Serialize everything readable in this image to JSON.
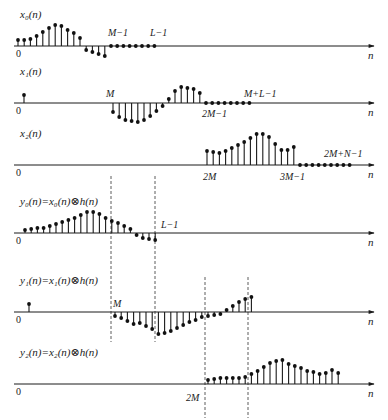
{
  "figure": {
    "axis_label": "n",
    "zero_label": "0"
  },
  "panels": [
    {
      "id": "x0",
      "title": "x₀(n)",
      "axis_y": 46,
      "ticks": [
        {
          "text": "M−1",
          "x": 108,
          "y": 36
        },
        {
          "text": "L−1",
          "x": 150,
          "y": 36
        }
      ],
      "stems": {
        "x_start": 18,
        "dx": 6.2,
        "values": [
          6,
          6,
          7,
          10,
          14,
          18,
          21,
          20,
          16,
          13,
          8,
          -4,
          -6,
          -8,
          -10,
          0,
          0,
          0,
          0,
          0,
          0,
          0,
          0
        ]
      }
    },
    {
      "id": "x1",
      "title": "x₁(n)",
      "axis_y": 103,
      "ticks": [
        {
          "text": "M",
          "x": 106,
          "y": 97
        },
        {
          "text": "2M−1",
          "x": 202,
          "y": 117
        },
        {
          "text": "M+L−1",
          "x": 244,
          "y": 97
        }
      ],
      "stems": {
        "x_start": 24,
        "dx": 6.2,
        "values_sparse": [
          {
            "i": 0,
            "v": 8
          }
        ],
        "x_start2": 113,
        "values": [
          -9,
          -14,
          -17,
          -18,
          -19,
          -17,
          -13,
          -8,
          -3,
          4,
          12,
          16,
          15,
          14,
          10,
          0,
          0,
          0,
          0,
          0,
          0,
          0,
          0
        ]
      }
    },
    {
      "id": "x2",
      "title": "x₂(n)",
      "axis_y": 165,
      "ticks": [
        {
          "text": "2M",
          "x": 203,
          "y": 180
        },
        {
          "text": "3M−1",
          "x": 280,
          "y": 180
        },
        {
          "text": "2M+N−1",
          "x": 324,
          "y": 157
        }
      ],
      "stems": {
        "x_start": 207,
        "dx": 6.2,
        "values": [
          14,
          13,
          12,
          14,
          17,
          20,
          23,
          27,
          31,
          31,
          28,
          21,
          15,
          15,
          18,
          0,
          0,
          0,
          0,
          0,
          0,
          0,
          0,
          0
        ]
      }
    },
    {
      "id": "y0",
      "title": "y₀(n)=x₀(n)⊗h(n)",
      "axis_y": 233,
      "ticks": [
        {
          "text": "L−1",
          "x": 161,
          "y": 228
        }
      ],
      "stems": {
        "x_start": 25,
        "dx": 6.2,
        "values": [
          3,
          4,
          5,
          5,
          7,
          9,
          11,
          13,
          15,
          18,
          21,
          21,
          19,
          15,
          12,
          10,
          7,
          4,
          -2,
          -5,
          -6,
          -7
        ]
      }
    },
    {
      "id": "y1",
      "title": "y₁(n)=x₁(n)⊗h(n)",
      "axis_y": 312,
      "ticks": [
        {
          "text": "M",
          "x": 113,
          "y": 307
        }
      ],
      "stems": {
        "x_start": 29,
        "dx": 6.2,
        "values_sparse": [
          {
            "i": 0,
            "v": 8
          }
        ],
        "x_start2": 115,
        "values": [
          -4,
          -6,
          -9,
          -12,
          -11,
          -14,
          -17,
          -22,
          -21,
          -19,
          -16,
          -13,
          -10,
          -8,
          -5,
          -4,
          -3,
          -2,
          2,
          6,
          10,
          13,
          15
        ]
      }
    },
    {
      "id": "y2",
      "title": "y₂(n)=x₂(n)⊗h(n)",
      "axis_y": 384,
      "ticks": [
        {
          "text": "2M",
          "x": 186,
          "y": 401
        }
      ],
      "stems": {
        "x_start": 208,
        "dx": 6.2,
        "values": [
          4,
          5,
          6,
          6,
          6,
          6,
          7,
          10,
          13,
          17,
          21,
          23,
          24,
          20,
          18,
          16,
          13,
          12,
          10,
          11,
          14,
          11
        ]
      }
    }
  ],
  "dashed_lines": [
    {
      "x": 111,
      "y1": 176,
      "y2": 342
    },
    {
      "x": 155,
      "y1": 176,
      "y2": 342
    },
    {
      "x": 205,
      "y1": 277,
      "y2": 418
    },
    {
      "x": 248,
      "y1": 277,
      "y2": 418
    }
  ],
  "layout": {
    "axis_x0": 14,
    "axis_x1": 374,
    "title_x": 20,
    "title_offset": -28
  }
}
